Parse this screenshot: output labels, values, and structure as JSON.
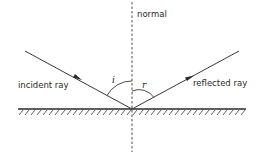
{
  "diagram": {
    "labels": {
      "normal": "normal",
      "incident_ray": "incident ray",
      "reflected_ray": "reflected ray",
      "angle_incidence": "i",
      "angle_reflection": "r"
    },
    "colors": {
      "line": "#3a3a3a",
      "background": "#ffffff"
    }
  }
}
